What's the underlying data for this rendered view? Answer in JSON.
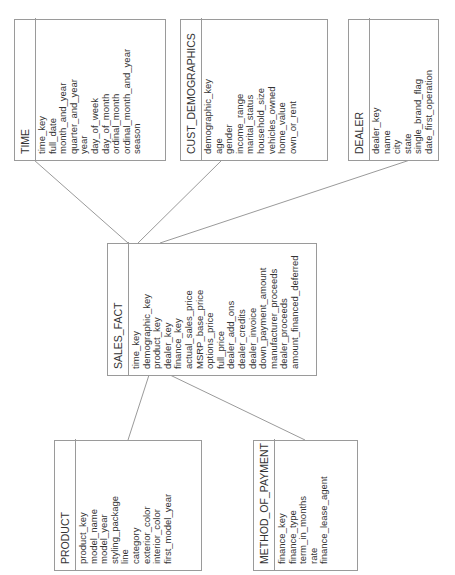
{
  "diagram": {
    "type": "star-schema",
    "line_color": "#9a9a9a",
    "entities": {
      "time": {
        "name": "TIME",
        "attributes": [
          "time_key",
          "full_date",
          "month_and_year",
          "quarter_and_year",
          "year",
          "day_of_week",
          "day_of_month",
          "ordinal_month",
          "ordinal_month_and_year",
          "season"
        ]
      },
      "cust_demographics": {
        "name": "CUST_DEMOGRAPHICS",
        "attributes": [
          "demographic_key",
          "age",
          "gender",
          "income_range",
          "marital_status",
          "household_size",
          "vehicles_owned",
          "home_value",
          "own_or_rent"
        ]
      },
      "dealer": {
        "name": "DEALER",
        "attributes": [
          "dealer_key",
          "name",
          "city",
          "state",
          "single_brand_flag",
          "date_first_operation"
        ]
      },
      "sales_fact": {
        "name": "SALES_FACT",
        "attributes": [
          "time_key",
          "demographic_key",
          "product_key",
          "dealer_key",
          "finance_key",
          "actual_sales_price",
          "MSRP_base_price",
          "options_price",
          "full_price",
          "dealer_add_ons",
          "dealer_credits",
          "dealer_invoice",
          "down_payment_amount",
          "manufacturer_proceeds",
          "dealer_proceeds",
          "amount_financed_deferred"
        ]
      },
      "product": {
        "name": "PRODUCT",
        "attributes": [
          "product_key",
          "model_name",
          "model_year",
          "styling_package",
          "line",
          "category",
          "exterior_color",
          "interior_color",
          "first_model_year"
        ]
      },
      "method_of_payment": {
        "name": "METHOD_OF_PAYMENT",
        "attributes": [
          "finance_key",
          "finance_type",
          "term_in_months",
          "rate",
          "finance_lease_agent"
        ]
      }
    },
    "relationships": [
      {
        "from": "sales_fact",
        "to": "time"
      },
      {
        "from": "sales_fact",
        "to": "cust_demographics"
      },
      {
        "from": "sales_fact",
        "to": "dealer"
      },
      {
        "from": "sales_fact",
        "to": "product"
      },
      {
        "from": "sales_fact",
        "to": "method_of_payment"
      }
    ]
  }
}
